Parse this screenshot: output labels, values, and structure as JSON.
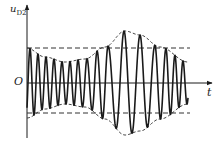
{
  "figure": {
    "y_axis_label": "u",
    "y_axis_label_sub": "D2",
    "x_axis_label": "t",
    "origin_label": "O",
    "colors": {
      "stroke": "#1a1a1a",
      "dashed": "#333333",
      "background": "#ffffff"
    }
  },
  "geometry": {
    "axis_x": 27,
    "zero_y": 83,
    "y_axis_top": 5,
    "y_axis_bottom": 138,
    "x_axis_end": 212,
    "dashed_upper_y": 48,
    "dashed_lower_y": 113,
    "dashed_x_start": 27,
    "dashed_x_end": 190
  },
  "waveform": {
    "description": "Frequency- and amplitude-varying signal with dashed envelope",
    "x_start": 27,
    "x_end": 188,
    "peak_positions_x": [
      30,
      38,
      46,
      54,
      62,
      70,
      78,
      87,
      97,
      108,
      124,
      140,
      155,
      166,
      175,
      183
    ],
    "envelope_points": [
      [
        27,
        35
      ],
      [
        45,
        26
      ],
      [
        65,
        21
      ],
      [
        85,
        24
      ],
      [
        105,
        36
      ],
      [
        125,
        52
      ],
      [
        140,
        48
      ],
      [
        160,
        36
      ],
      [
        188,
        21
      ]
    ]
  }
}
